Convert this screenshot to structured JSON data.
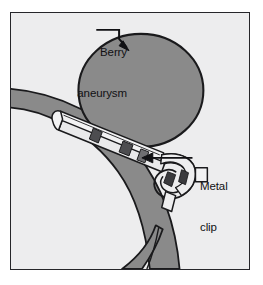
{
  "figure": {
    "type": "medical-illustration",
    "background_color": "#ededee",
    "frame_color": "#26262a",
    "vessel_color": "#8a8a8a",
    "aneurysm_color": "#8a8a8a",
    "clip_color": "#e8e8e8",
    "outline_color": "#1a1a1c",
    "label_color": "#111114"
  },
  "labels": {
    "berry_aneurysm": {
      "line1": "Berry",
      "line2": "aneurysm",
      "full": "Berry aneurysm"
    },
    "metal_clip": {
      "line1": "Metal",
      "line2": "clip",
      "full": "Metal clip"
    }
  },
  "annotations": [
    {
      "name": "berry-aneurysm-leader",
      "label": "Berry aneurysm",
      "points_to": "aneurysm-dome",
      "arrow_direction": "down-right"
    },
    {
      "name": "metal-clip-leader",
      "label": "Metal clip",
      "points_to": "clip-body",
      "arrow_direction": "left"
    }
  ],
  "anatomy": {
    "artery": "parent cerebral artery with distal bifurcation",
    "aneurysm": "saccular berry aneurysm arising from artery wall",
    "device": "spring-loaded metal aneurysm clip across the aneurysm neck"
  }
}
